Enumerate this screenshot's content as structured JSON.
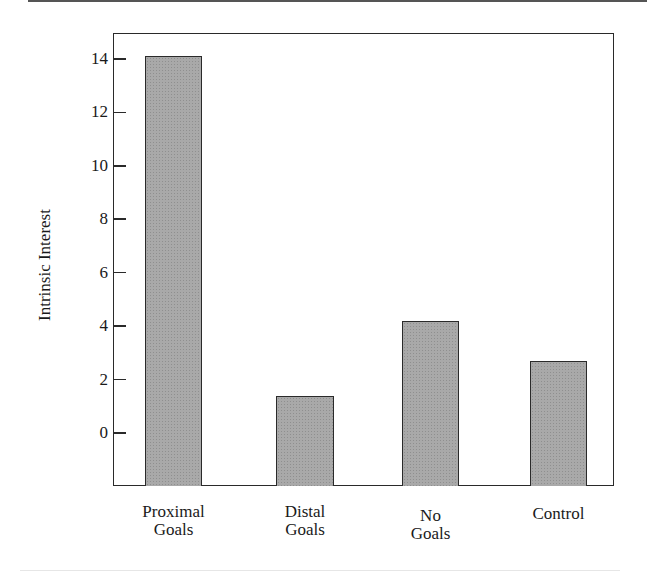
{
  "chart_data": {
    "type": "bar",
    "title": "",
    "xlabel": "",
    "ylabel": "Intrinsic Interest",
    "categories": [
      "Proximal Goals",
      "Distal Goals",
      "No Goals",
      "Control"
    ],
    "category_lines": [
      [
        "Proximal",
        "Goals"
      ],
      [
        "Distal",
        "Goals"
      ],
      [
        "No",
        "Goals"
      ],
      [
        "Control",
        ""
      ]
    ],
    "values": [
      14.1,
      1.4,
      4.2,
      2.7
    ],
    "yticks": [
      0,
      2,
      4,
      6,
      8,
      10,
      12,
      14
    ],
    "ytick_labels": [
      "0",
      "2",
      "4",
      "6",
      "8",
      "10",
      "12",
      "14"
    ],
    "ylim": [
      -2,
      15
    ],
    "grid": false,
    "legend": null,
    "bar_color": "#a9a9a9",
    "edge_color": "#2a2a2a"
  }
}
